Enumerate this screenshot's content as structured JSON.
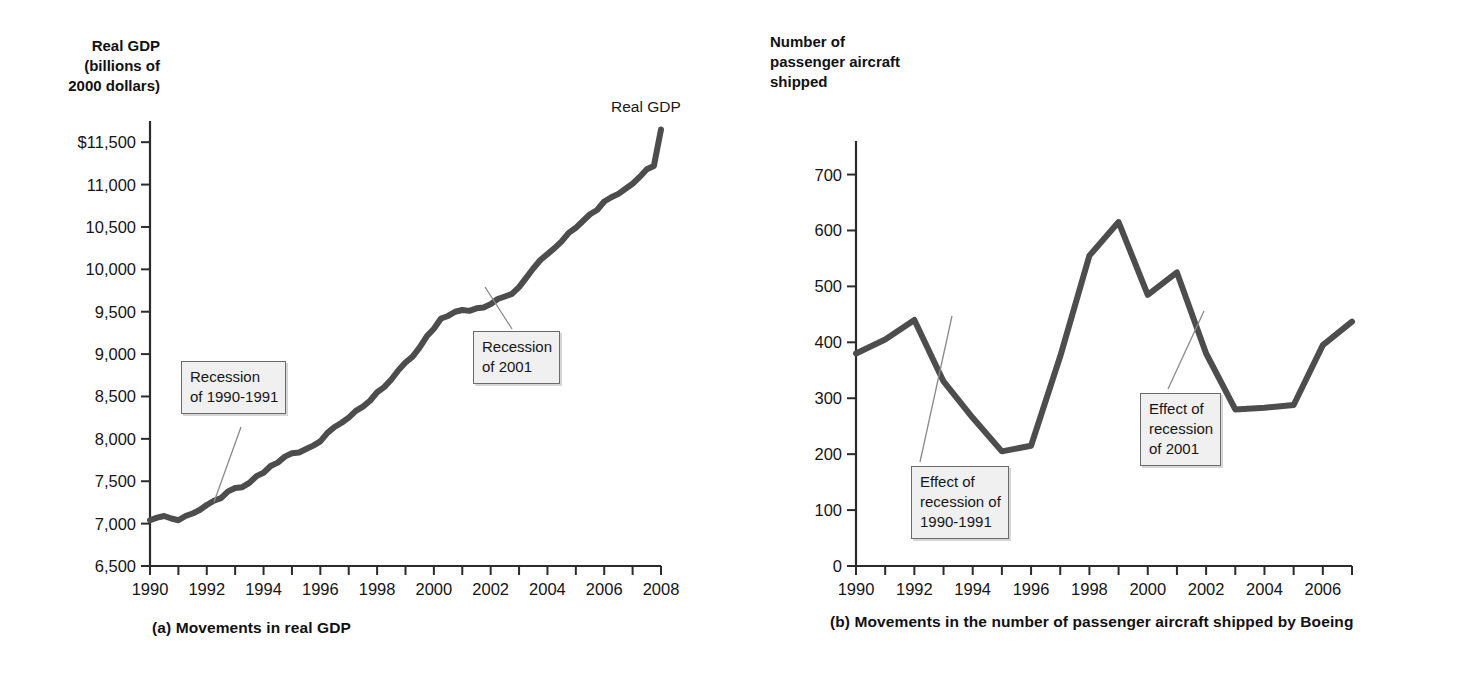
{
  "figure": {
    "background": "#ffffff",
    "line_color": "#4d4d4d",
    "axis_color": "#2b2b2b",
    "annotation_bg": "#f0f0f0",
    "annotation_border": "#6b6b6b"
  },
  "panel_a": {
    "caption": "(a) Movements in real GDP",
    "axis_title": "Real GDP\n(billions of\n2000 dollars)",
    "series_label": "Real GDP",
    "annotations": [
      {
        "name": "recession-1990-1991",
        "text": "Recession\nof 1990-1991"
      },
      {
        "name": "recession-2001",
        "text": "Recession\nof 2001"
      }
    ]
  },
  "panel_b": {
    "caption": "(b) Movements in the number of passenger aircraft shipped by Boeing",
    "axis_title": "Number of\npassenger aircraft\nshipped",
    "annotations": [
      {
        "name": "effect-recession-1990-1991",
        "text": "Effect of\nrecession of\n1990-1991"
      },
      {
        "name": "effect-recession-2001",
        "text": "Effect of\nrecession\nof 2001"
      }
    ]
  },
  "chart_data": [
    {
      "type": "line",
      "name": "real-gdp",
      "title": "(a) Movements in real GDP",
      "xlabel": "",
      "ylabel": "Real GDP (billions of 2000 dollars)",
      "ylim": [
        6500,
        11750
      ],
      "xlim": [
        1990,
        2008
      ],
      "grid": false,
      "legend": "none",
      "ytick_labels": [
        "$11,500",
        "11,000",
        "10,500",
        "10,000",
        "9,500",
        "9,000",
        "8,500",
        "8,000",
        "7,500",
        "7,000",
        "6,500"
      ],
      "ytick_values": [
        11500,
        11000,
        10500,
        10000,
        9500,
        9000,
        8500,
        8000,
        7500,
        7000,
        6500
      ],
      "xtick_labels": [
        "1990",
        "1992",
        "1994",
        "1996",
        "1998",
        "2000",
        "2002",
        "2004",
        "2006",
        "2008"
      ],
      "xtick_values": [
        1990,
        1992,
        1994,
        1996,
        1998,
        2000,
        2002,
        2004,
        2006,
        2008
      ],
      "x": [
        1990,
        1990.25,
        1990.5,
        1990.75,
        1991,
        1991.25,
        1991.5,
        1991.75,
        1992,
        1992.25,
        1992.5,
        1992.75,
        1993,
        1993.25,
        1993.5,
        1993.75,
        1994,
        1994.25,
        1994.5,
        1994.75,
        1995,
        1995.25,
        1995.5,
        1995.75,
        1996,
        1996.25,
        1996.5,
        1996.75,
        1997,
        1997.25,
        1997.5,
        1997.75,
        1998,
        1998.25,
        1998.5,
        1998.75,
        1999,
        1999.25,
        1999.5,
        1999.75,
        2000,
        2000.25,
        2000.5,
        2000.75,
        2001,
        2001.25,
        2001.5,
        2001.75,
        2002,
        2002.25,
        2002.5,
        2002.75,
        2003,
        2003.25,
        2003.5,
        2003.75,
        2004,
        2004.25,
        2004.5,
        2004.75,
        2005,
        2005.25,
        2005.5,
        2005.75,
        2006,
        2006.25,
        2006.5,
        2006.75,
        2007,
        2007.25,
        2007.5,
        2007.75,
        2008
      ],
      "values": [
        7040,
        7070,
        7090,
        7060,
        7040,
        7090,
        7120,
        7160,
        7220,
        7270,
        7300,
        7380,
        7420,
        7430,
        7480,
        7560,
        7600,
        7680,
        7720,
        7790,
        7830,
        7840,
        7880,
        7920,
        7970,
        8070,
        8140,
        8190,
        8250,
        8330,
        8380,
        8450,
        8550,
        8610,
        8700,
        8810,
        8900,
        8970,
        9080,
        9210,
        9300,
        9420,
        9450,
        9500,
        9520,
        9510,
        9540,
        9550,
        9590,
        9650,
        9680,
        9710,
        9790,
        9900,
        10010,
        10110,
        10180,
        10250,
        10330,
        10430,
        10490,
        10570,
        10650,
        10700,
        10800,
        10850,
        10890,
        10950,
        11010,
        11090,
        11180,
        11220,
        11650
      ]
    },
    {
      "type": "line",
      "name": "boeing-passenger-aircraft-shipped",
      "title": "(b) Movements in the number of passenger aircraft shipped by Boeing",
      "xlabel": "",
      "ylabel": "Number of passenger aircraft shipped",
      "ylim": [
        0,
        760
      ],
      "xlim": [
        1990,
        2007
      ],
      "grid": false,
      "legend": "none",
      "ytick_labels": [
        "700",
        "600",
        "500",
        "400",
        "300",
        "200",
        "100",
        "0"
      ],
      "ytick_values": [
        700,
        600,
        500,
        400,
        300,
        200,
        100,
        0
      ],
      "xtick_labels": [
        "1990",
        "1992",
        "1994",
        "1996",
        "1998",
        "2000",
        "2002",
        "2004",
        "2006"
      ],
      "xtick_values": [
        1990,
        1992,
        1994,
        1996,
        1998,
        2000,
        2002,
        2004,
        2006
      ],
      "x": [
        1990,
        1991,
        1992,
        1993,
        1994,
        1995,
        1996,
        1997,
        1998,
        1999,
        2000,
        2001,
        2002,
        2003,
        2004,
        2005,
        2006,
        2007
      ],
      "values": [
        380,
        405,
        440,
        330,
        265,
        205,
        215,
        375,
        555,
        615,
        485,
        525,
        380,
        280,
        283,
        288,
        395,
        437
      ]
    }
  ]
}
